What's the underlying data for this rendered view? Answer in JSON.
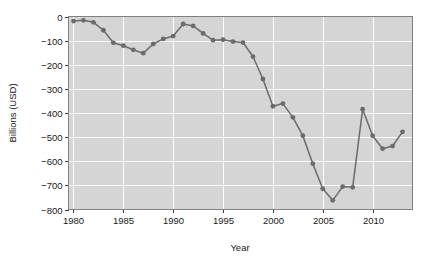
{
  "chart_data": {
    "type": "line",
    "title": "",
    "xlabel": "Year",
    "ylabel": "Billions (USD)",
    "xlim": [
      1979.5,
      2014.0
    ],
    "ylim": [
      -800,
      0
    ],
    "xticks": [
      1980,
      1985,
      1990,
      1995,
      2000,
      2005,
      2010
    ],
    "yticks": [
      0,
      -100,
      -200,
      -300,
      -400,
      -500,
      -600,
      -700,
      -800
    ],
    "xtick_labels": [
      "1980",
      "1985",
      "1990",
      "1995",
      "2000",
      "2005",
      "2010"
    ],
    "ytick_labels": [
      "0",
      "−100",
      "−200",
      "−300",
      "−400",
      "−500",
      "−600",
      "−700",
      "−800"
    ],
    "grid": true,
    "grid_color": "#ffffff",
    "plot_background": "#d5d5d5",
    "series_color": "#6b6b6b",
    "legend": null,
    "marker": "circle",
    "x": [
      1980,
      1981,
      1982,
      1983,
      1984,
      1985,
      1986,
      1987,
      1988,
      1989,
      1990,
      1991,
      1992,
      1993,
      1994,
      1995,
      1996,
      1997,
      1998,
      1999,
      2000,
      2001,
      2002,
      2003,
      2004,
      2005,
      2006,
      2007,
      2008,
      2009,
      2010,
      2011,
      2012,
      2013
    ],
    "values": [
      -19,
      -16,
      -24,
      -57,
      -109,
      -121,
      -138,
      -152,
      -114,
      -93,
      -81,
      -31,
      -39,
      -70,
      -98,
      -96,
      -104,
      -108,
      -166,
      -259,
      -372,
      -361,
      -418,
      -494,
      -610,
      -714,
      -762,
      -705,
      -708,
      -384,
      -494,
      -548,
      -537,
      -478
    ],
    "annotations": []
  },
  "axis": {
    "ylabel": "Billions (USD)",
    "xlabel": "Year"
  }
}
